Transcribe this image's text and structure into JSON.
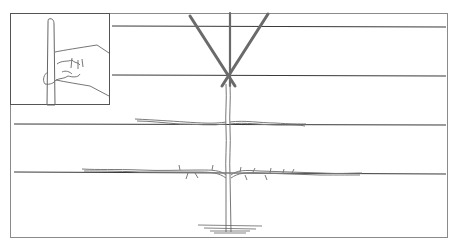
{
  "diagram": {
    "type": "illustration",
    "frame": {
      "x": 10,
      "y": 13,
      "width": 438,
      "height": 225
    },
    "wires": [
      {
        "y": 26,
        "x1": 112,
        "x2": 446
      },
      {
        "y": 75,
        "x1": 112,
        "x2": 446
      },
      {
        "y": 124,
        "x1": 14,
        "x2": 446
      },
      {
        "y": 173,
        "x1": 14,
        "x2": 446
      }
    ],
    "trunk": {
      "x": 228,
      "top": 85,
      "bottom": 232
    },
    "tiers": [
      {
        "y": 124,
        "left_end": 135,
        "right_end": 305
      },
      {
        "y": 172,
        "left_end": 82,
        "right_end": 362
      }
    ],
    "canes": [
      {
        "x1": 190,
        "y1": 16,
        "x2": 235,
        "y2": 86
      },
      {
        "x1": 230,
        "y1": 12,
        "x2": 230,
        "y2": 86
      },
      {
        "x1": 268,
        "y1": 14,
        "x2": 222,
        "y2": 86
      }
    ],
    "inset": {
      "x": 10,
      "y": 13,
      "width": 100,
      "height": 92,
      "subject": "hand-pinching-stem"
    },
    "colors": {
      "line": "#555555",
      "wire": "#3a3a3a",
      "frame": "#8a8a8a",
      "cane": "#666666",
      "wood": "#777777"
    }
  }
}
